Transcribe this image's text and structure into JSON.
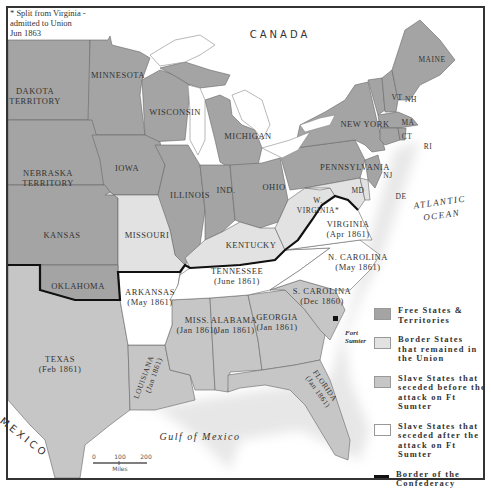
{
  "map": {
    "note": "* Split from Virginia - admitted to Union Jun 1863",
    "note_lines": [
      "* Split from Virginia -",
      "admitted to Union",
      "Jun 1863"
    ],
    "colors": {
      "free": "#a4a4a4",
      "border": "#e2e2e2",
      "seceded_before": "#c6c6c6",
      "seceded_after": "#ffffff",
      "water": "#ffffff",
      "foreign": "#ffffff",
      "confederacy_border": "#111111"
    },
    "countries": {
      "canada": "CANADA",
      "mexico": "MEXICO"
    },
    "water_bodies": {
      "atlantic": [
        "ATLANTIC",
        "OCEAN"
      ],
      "gulf": "Gulf of Mexico"
    },
    "states": {
      "dakota": [
        "DAKOTA",
        "TERRITORY"
      ],
      "minnesota": "MINNESOTA",
      "wisconsin": "WISCONSIN",
      "michigan": "MICHIGAN",
      "nebraska": [
        "NEBRASKA",
        "TERRITORY"
      ],
      "iowa": "IOWA",
      "illinois": "ILLINOIS",
      "indiana": "IND.",
      "ohio": "OHIO",
      "pennsylvania": "PENNSYLVANIA",
      "new_york": "NEW YORK",
      "maine": "MAINE",
      "vermont": "VT",
      "new_hampshire": "NH",
      "massachusetts": "MA",
      "connecticut": "CT",
      "rhode_island": "RI",
      "new_jersey": "NJ",
      "delaware": "DE",
      "maryland": "MD",
      "kansas": "KANSAS",
      "missouri": "MISSOURI",
      "kentucky": "KENTUCKY",
      "west_virginia": [
        "W.",
        "VIRGINIA*"
      ],
      "virginia": [
        "VIRGINIA",
        "(Apr 1861)"
      ],
      "oklahoma": "OKLAHOMA",
      "arkansas": [
        "ARKANSAS",
        "(May 1861)"
      ],
      "tennessee": [
        "TENNESSEE",
        "(June 1861)"
      ],
      "north_carolina": [
        "N. CAROLINA",
        "(May 1861)"
      ],
      "south_carolina": [
        "S. CAROLINA",
        "(Dec 1860)"
      ],
      "texas": [
        "TEXAS",
        "(Feb 1861)"
      ],
      "louisiana": [
        "LOUISIANA",
        "(Jan 1861)"
      ],
      "mississippi": [
        "MISS.",
        "(Jan 1861)"
      ],
      "alabama": [
        "ALABAMA",
        "(Jan 1861)"
      ],
      "georgia": [
        "GEORGIA",
        "(Jan 1861)"
      ],
      "florida": [
        "FLORIDA",
        "(Jan 1861)"
      ]
    },
    "markers": {
      "fort_sumter": [
        "Fort",
        "Sumter"
      ]
    },
    "scale": {
      "ticks": [
        "0",
        "100",
        "200"
      ],
      "unit": "Miles"
    }
  },
  "legend": {
    "items": [
      {
        "label": "Free States & Territories",
        "lines": [
          "Free States &",
          "Territories"
        ],
        "color": "#a4a4a4"
      },
      {
        "label": "Border States that remained in the Union",
        "lines": [
          "Border States",
          "that remained in",
          "the Union"
        ],
        "color": "#e2e2e2"
      },
      {
        "label": "Slave States that seceded before the attack on Ft Sumter",
        "lines": [
          "Slave States that",
          "seceded before the",
          "attack on Ft Sumter"
        ],
        "color": "#c6c6c6"
      },
      {
        "label": "Slave States that seceded after the attack on Ft Sumter",
        "lines": [
          "Slave States that",
          "seceded after the",
          "attack on Ft Sumter"
        ],
        "color": "#ffffff"
      },
      {
        "label": "Border of the Confederacy",
        "lines": [
          "Border of the",
          "Confederacy"
        ],
        "color": "#111111"
      }
    ]
  }
}
